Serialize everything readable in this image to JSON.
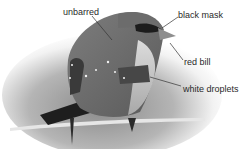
{
  "figure": {
    "annotations": [
      {
        "id": "unbarred",
        "text": "unbarred"
      },
      {
        "id": "black-mask",
        "text": "black mask"
      },
      {
        "id": "red-bill",
        "text": "red bill"
      },
      {
        "id": "white-droplets",
        "text": "white droplets"
      }
    ]
  }
}
